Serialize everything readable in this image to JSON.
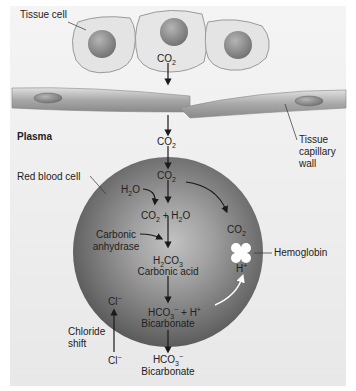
{
  "labels": {
    "tissue_cell": "Tissue cell",
    "plasma": "Plasma",
    "tissue_capillary_wall": [
      "Tissue",
      "capillary",
      "wall"
    ],
    "red_blood_cell": "Red blood cell",
    "carbonic_anhydrase": [
      "Carbonic",
      "anhydrase"
    ],
    "hemoglobin": "Hemoglobin",
    "chloride_shift": [
      "Chloride",
      "shift"
    ],
    "carbonic_acid": "Carbonic acid",
    "bicarbonate_inside": "Bicarbonate",
    "bicarbonate_outside": "Bicarbonate"
  },
  "formulas": {
    "co2_tissue": {
      "base": "CO",
      "sub": "2"
    },
    "co2_plasma": {
      "base": "CO",
      "sub": "2"
    },
    "co2_rbc": {
      "base": "CO",
      "sub": "2"
    },
    "h2o": {
      "a": "H",
      "sub": "2",
      "b": "O"
    },
    "co2_plus_h2o": {
      "a": "CO",
      "sub1": "2",
      "mid": " + H",
      "sub2": "2",
      "b": "O"
    },
    "co2_hemoglobin": {
      "base": "CO",
      "sub": "2"
    },
    "h2co3": {
      "a": "H",
      "sub1": "2",
      "b": "CO",
      "sub2": "3"
    },
    "h_plus_hemoglobin": {
      "base": "H",
      "sup": "+"
    },
    "hco3_plus_h": {
      "a": "HCO",
      "sub": "3",
      "sup": "−",
      "mid": " + H",
      "sup2": "+"
    },
    "cl_inside": {
      "base": "Cl",
      "sup": "−"
    },
    "cl_outside": {
      "base": "Cl",
      "sup": "−"
    },
    "hco3_outside": {
      "a": "HCO",
      "sub": "3",
      "sup": "−"
    }
  },
  "colors": {
    "background_panel": "#ececec",
    "rbc_dark": "#5e5e5e",
    "rbc_light": "#b8b8b8",
    "cell_fill": "#e6e6e6",
    "nucleus": "#8a8a8a",
    "capillary_wall": "#9a9a9a",
    "text": "#222222"
  }
}
